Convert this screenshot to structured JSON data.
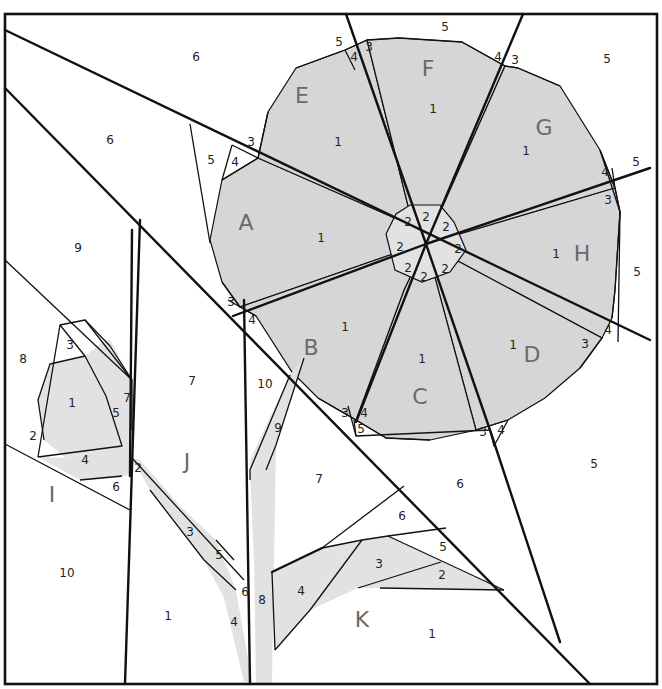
{
  "diagram": {
    "colors": {
      "shaded": "#d6d6d6",
      "light": "#e2e2e2",
      "line": "#111111",
      "section_label": "#6a6a6a"
    },
    "frame": {
      "x": 5,
      "y": 14,
      "w": 652,
      "h": 670
    },
    "shaded_polygons": [
      {
        "name": "A1",
        "points": "258,158 413,226 426,244 393,254 240,307 222,282 210,240 222,180"
      },
      {
        "name": "E1",
        "points": "296,68 345,50 367,40 413,226 258,158 268,112"
      },
      {
        "name": "F1",
        "points": "367,40 399,38 462,42 505,66 426,244 413,226"
      },
      {
        "name": "G1",
        "points": "505,66 518,68 560,86 600,150 615,188 426,244"
      },
      {
        "name": "H1",
        "points": "426,244 615,188 620,212 615,290 612,318 602,338"
      },
      {
        "name": "D1",
        "points": "426,244 602,338 580,368 545,398 508,420 476,430"
      },
      {
        "name": "C1",
        "points": "426,244 476,430 430,440 386,438 356,420 404,290"
      },
      {
        "name": "B1",
        "points": "426,244 404,290 356,420 318,398 292,372 256,316 240,307 393,254"
      }
    ],
    "center_polygons": [
      {
        "name": "center-octagon",
        "points": "410,205 440,205 454,222 466,250 450,272 422,282 395,270 386,234 396,214"
      }
    ],
    "light_polygons": [
      {
        "name": "I1",
        "points": "50,364 85,356 106,396 122,446 66,458 44,440 38,400"
      },
      {
        "name": "I5",
        "points": "85,356 100,344 110,340 132,380 130,474 118,478 106,396"
      },
      {
        "name": "I4",
        "points": "38,457 66,458 122,446 118,478 80,480"
      },
      {
        "name": "stem9",
        "points": "290,375 304,356 304,358 276,445 266,470 250,480 250,460"
      },
      {
        "name": "stem8",
        "points": "250,470 266,470 276,445 272,685 256,685 254,560"
      },
      {
        "name": "J-stem",
        "points": "132,458 140,460 180,506 216,540 236,590 252,682 244,682 224,598 204,560 150,490"
      },
      {
        "name": "K4",
        "points": "272,572 322,548 362,540 340,558 310,610 275,650"
      },
      {
        "name": "K3",
        "points": "362,540 388,536 441,562 358,588 310,610 340,558"
      },
      {
        "name": "K2",
        "points": "441,562 504,590 380,588 358,588"
      }
    ],
    "bold_lines": [
      {
        "name": "line-top-diagonal",
        "d": "M5,30 L650,340"
      },
      {
        "name": "line-left-diagonal",
        "d": "M5,88 L590,684"
      },
      {
        "name": "spoke-ef",
        "d": "M346,14 L426,244"
      },
      {
        "name": "spoke-fg",
        "d": "M523,14 L426,244"
      },
      {
        "name": "spoke-gh",
        "d": "M650,168 L426,244"
      },
      {
        "name": "spoke-ab",
        "d": "M233,316 L426,244"
      },
      {
        "name": "spoke-bc",
        "d": "M426,244 L356,422"
      },
      {
        "name": "spoke-cd",
        "d": "M426,244 L490,430 L560,642"
      },
      {
        "name": "J-left-edge",
        "d": "M140,220 L125,684"
      },
      {
        "name": "I-right-edge",
        "d": "M132,230 L130,476"
      },
      {
        "name": "stem-column-left",
        "d": "M244,300 L250,684"
      },
      {
        "name": "K-bottom-triangle",
        "d": "M322,548 L272,572"
      }
    ],
    "seam_lines": [
      "M5,260 L132,380",
      "M5,444 L130,510",
      "M38,457 L60,325 L85,320 L132,380 L132,430",
      "M60,325 L85,356",
      "M85,320 L110,346 L132,380",
      "M85,356 L106,396 L122,446 L38,457",
      "M44,440 L38,400 L50,364 L85,356",
      "M80,480 L122,476",
      "M190,124 L210,243",
      "M232,145 L222,180",
      "M268,112 L258,158 L232,145",
      "M222,180 L258,158",
      "M222,282 L240,307",
      "M228,300 L256,316",
      "M296,68 L345,50 L367,40",
      "M345,50 L355,70",
      "M367,40 L399,38",
      "M399,38 L462,42 L505,66",
      "M505,66 L518,68 L560,86",
      "M600,150 L615,188 L612,168",
      "M615,188 L620,212 L615,290 L612,318",
      "M620,212 L618,342",
      "M600,150 L620,212",
      "M602,338 L580,368",
      "M318,398 L356,420 L386,438 L430,440",
      "M354,420 L356,436",
      "M348,406 L356,436 L490,430",
      "M476,430 L508,420",
      "M490,430 L494,446 L508,420",
      "M290,375 L250,470 L250,480",
      "M304,358 L276,445 L266,470",
      "M132,458 L244,580",
      "M150,490 L204,560 L236,590",
      "M216,540 L234,560",
      "M322,548 L404,486",
      "M322,548 L362,540 L388,536 L446,528",
      "M362,540 L310,610 L275,650",
      "M388,536 L504,590",
      "M358,588 L441,562",
      "M380,588 L504,590",
      "M275,650 L272,572"
    ],
    "section_labels": [
      {
        "id": "A",
        "x": 246,
        "y": 224
      },
      {
        "id": "B",
        "x": 311,
        "y": 349
      },
      {
        "id": "C",
        "x": 420,
        "y": 398
      },
      {
        "id": "D",
        "x": 532,
        "y": 356
      },
      {
        "id": "E",
        "x": 302,
        "y": 97
      },
      {
        "id": "F",
        "x": 428,
        "y": 70
      },
      {
        "id": "G",
        "x": 544,
        "y": 129
      },
      {
        "id": "H",
        "x": 582,
        "y": 255
      },
      {
        "id": "I",
        "x": 52,
        "y": 496
      },
      {
        "id": "J",
        "x": 187,
        "y": 463
      },
      {
        "id": "K",
        "x": 362,
        "y": 621
      }
    ],
    "piece_numbers": [
      {
        "n": "6",
        "x": 196,
        "y": 57
      },
      {
        "n": "6",
        "x": 110,
        "y": 140
      },
      {
        "n": "9",
        "x": 78,
        "y": 248
      },
      {
        "n": "5",
        "x": 211,
        "y": 160
      },
      {
        "n": "3",
        "x": 251,
        "y": 142
      },
      {
        "n": "4",
        "x": 235,
        "y": 162
      },
      {
        "n": "5",
        "x": 339,
        "y": 42
      },
      {
        "n": "4",
        "x": 354,
        "y": 57
      },
      {
        "n": "3",
        "x": 369,
        "y": 47
      },
      {
        "n": "1",
        "x": 338,
        "y": 142
      },
      {
        "n": "5",
        "x": 445,
        "y": 27
      },
      {
        "n": "1",
        "x": 433,
        "y": 109
      },
      {
        "n": "4",
        "x": 498,
        "y": 57
      },
      {
        "n": "3",
        "x": 515,
        "y": 60
      },
      {
        "n": "5",
        "x": 607,
        "y": 59
      },
      {
        "n": "1",
        "x": 526,
        "y": 151
      },
      {
        "n": "4",
        "x": 605,
        "y": 172
      },
      {
        "n": "5",
        "x": 636,
        "y": 162
      },
      {
        "n": "3",
        "x": 608,
        "y": 200
      },
      {
        "n": "1",
        "x": 556,
        "y": 254
      },
      {
        "n": "5",
        "x": 637,
        "y": 272
      },
      {
        "n": "4",
        "x": 608,
        "y": 330
      },
      {
        "n": "3",
        "x": 585,
        "y": 344
      },
      {
        "n": "1",
        "x": 321,
        "y": 238
      },
      {
        "n": "3",
        "x": 231,
        "y": 302
      },
      {
        "n": "4",
        "x": 252,
        "y": 320
      },
      {
        "n": "1",
        "x": 345,
        "y": 327
      },
      {
        "n": "1",
        "x": 422,
        "y": 359
      },
      {
        "n": "1",
        "x": 513,
        "y": 345
      },
      {
        "n": "2",
        "x": 408,
        "y": 222
      },
      {
        "n": "2",
        "x": 426,
        "y": 217
      },
      {
        "n": "2",
        "x": 446,
        "y": 227
      },
      {
        "n": "2",
        "x": 458,
        "y": 249
      },
      {
        "n": "2",
        "x": 445,
        "y": 269
      },
      {
        "n": "2",
        "x": 424,
        "y": 277
      },
      {
        "n": "2",
        "x": 408,
        "y": 268
      },
      {
        "n": "2",
        "x": 400,
        "y": 247
      },
      {
        "n": "3",
        "x": 345,
        "y": 413
      },
      {
        "n": "4",
        "x": 364,
        "y": 413
      },
      {
        "n": "5",
        "x": 361,
        "y": 429
      },
      {
        "n": "3",
        "x": 483,
        "y": 432
      },
      {
        "n": "4",
        "x": 501,
        "y": 430
      },
      {
        "n": "8",
        "x": 23,
        "y": 359
      },
      {
        "n": "3",
        "x": 70,
        "y": 345
      },
      {
        "n": "1",
        "x": 72,
        "y": 403
      },
      {
        "n": "5",
        "x": 116,
        "y": 413
      },
      {
        "n": "7",
        "x": 127,
        "y": 398
      },
      {
        "n": "2",
        "x": 33,
        "y": 436
      },
      {
        "n": "4",
        "x": 85,
        "y": 460
      },
      {
        "n": "6",
        "x": 116,
        "y": 487
      },
      {
        "n": "10",
        "x": 67,
        "y": 573
      },
      {
        "n": "7",
        "x": 192,
        "y": 381
      },
      {
        "n": "10",
        "x": 265,
        "y": 384
      },
      {
        "n": "9",
        "x": 278,
        "y": 428
      },
      {
        "n": "2",
        "x": 138,
        "y": 468
      },
      {
        "n": "3",
        "x": 190,
        "y": 532
      },
      {
        "n": "5",
        "x": 219,
        "y": 555
      },
      {
        "n": "6",
        "x": 245,
        "y": 592
      },
      {
        "n": "8",
        "x": 262,
        "y": 600
      },
      {
        "n": "4",
        "x": 234,
        "y": 622
      },
      {
        "n": "1",
        "x": 168,
        "y": 616
      },
      {
        "n": "7",
        "x": 319,
        "y": 479
      },
      {
        "n": "6",
        "x": 460,
        "y": 484
      },
      {
        "n": "6",
        "x": 402,
        "y": 516
      },
      {
        "n": "5",
        "x": 443,
        "y": 547
      },
      {
        "n": "3",
        "x": 379,
        "y": 564
      },
      {
        "n": "2",
        "x": 442,
        "y": 575
      },
      {
        "n": "4",
        "x": 301,
        "y": 591
      },
      {
        "n": "1",
        "x": 432,
        "y": 634
      },
      {
        "n": "5",
        "x": 594,
        "y": 464
      }
    ]
  }
}
